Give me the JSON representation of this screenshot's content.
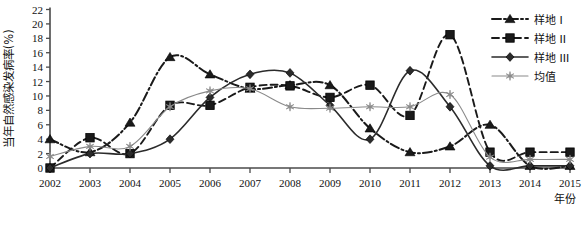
{
  "chart_data": {
    "type": "line",
    "title": "",
    "xlabel": "年份",
    "ylabel": "当年自然感染发病率(%)",
    "x": [
      2002,
      2003,
      2004,
      2005,
      2006,
      2007,
      2008,
      2009,
      2010,
      2011,
      2012,
      2013,
      2014,
      2015
    ],
    "xtick_labels": [
      "2002",
      "2003",
      "2004",
      "2005",
      "2006",
      "2007",
      "2008",
      "2009",
      "2010",
      "2011",
      "2012",
      "2013",
      "2014",
      "2015"
    ],
    "ylim": [
      0,
      22
    ],
    "ytick_labels": [
      "0",
      "2",
      "4",
      "6",
      "8",
      "10",
      "12",
      "14",
      "16",
      "18",
      "20",
      "22"
    ],
    "yticks": [
      0,
      2,
      4,
      6,
      8,
      10,
      12,
      14,
      16,
      18,
      20,
      22
    ],
    "grid": false,
    "legend_position": "right",
    "series": [
      {
        "name": "样地 I",
        "marker": "triangle",
        "line_style": "dash-dot",
        "color": "#1a1a1a",
        "values": [
          4.0,
          2.2,
          6.3,
          15.4,
          13.0,
          11.0,
          11.5,
          11.5,
          5.5,
          2.2,
          3.0,
          6.0,
          0.3,
          0.3
        ]
      },
      {
        "name": "样地 II",
        "marker": "square",
        "line_style": "dashed",
        "color": "#1a1a1a",
        "values": [
          0.0,
          4.2,
          2.0,
          8.7,
          8.7,
          11.2,
          11.4,
          9.8,
          11.5,
          7.3,
          18.5,
          2.2,
          2.2,
          2.2
        ]
      },
      {
        "name": "样地 III",
        "marker": "diamond",
        "line_style": "solid",
        "color": "#2b2b2b",
        "values": [
          0.0,
          2.0,
          2.0,
          4.0,
          9.8,
          13.0,
          13.2,
          8.7,
          4.0,
          13.5,
          8.5,
          0.3,
          0.3,
          0.3
        ]
      },
      {
        "name": "均值",
        "marker": "star",
        "line_style": "solid-thin",
        "color": "#8a8a8a",
        "values": [
          1.6,
          3.0,
          3.0,
          8.5,
          10.7,
          11.0,
          8.5,
          8.3,
          8.5,
          8.5,
          10.2,
          1.5,
          1.2,
          1.2
        ]
      }
    ]
  },
  "legend": {
    "items": [
      {
        "label": "样地 I"
      },
      {
        "label": "样地 II"
      },
      {
        "label": "样地 III"
      },
      {
        "label": "均值"
      }
    ]
  }
}
